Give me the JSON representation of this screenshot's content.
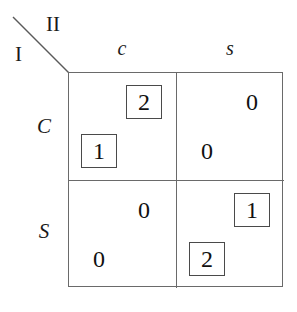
{
  "figure": {
    "type": "payoff-matrix",
    "players": {
      "row_player_label": "I",
      "column_player_label": "II"
    },
    "column_headers": [
      "c",
      "s"
    ],
    "row_headers": [
      "C",
      "S"
    ],
    "cells": [
      {
        "row": "C",
        "column": "c",
        "row_payoff": "1",
        "row_payoff_boxed": true,
        "column_payoff": "2",
        "column_payoff_boxed": true
      },
      {
        "row": "C",
        "column": "s",
        "row_payoff": "0",
        "row_payoff_boxed": false,
        "column_payoff": "0",
        "column_payoff_boxed": false
      },
      {
        "row": "S",
        "column": "c",
        "row_payoff": "0",
        "row_payoff_boxed": false,
        "column_payoff": "0",
        "column_payoff_boxed": false
      },
      {
        "row": "S",
        "column": "s",
        "row_payoff": "2",
        "row_payoff_boxed": true,
        "column_payoff": "1",
        "column_payoff_boxed": true
      }
    ],
    "colors": {
      "grid_line": "#6a6a6a",
      "box_outline": "#4a4a4a",
      "text": "#111111",
      "background": "#ffffff"
    }
  }
}
